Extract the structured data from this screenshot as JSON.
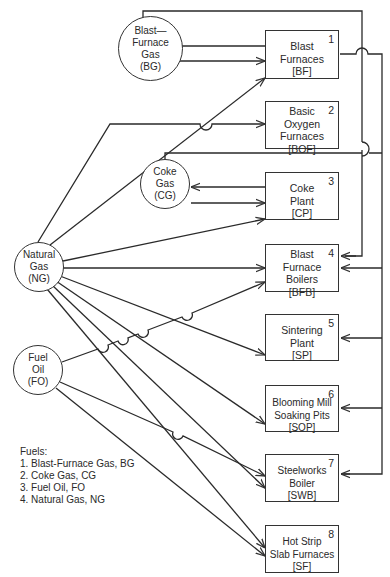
{
  "diagram": {
    "type": "energy flow diagram",
    "fuel_sources": [
      {
        "id": "BG",
        "lines": [
          "Blast—",
          "Furnace",
          "Gas",
          "(BG)"
        ]
      },
      {
        "id": "CG",
        "lines": [
          "Coke",
          "Gas",
          "(CG)"
        ]
      },
      {
        "id": "NG",
        "lines": [
          "Natural",
          "Gas",
          "(NG)"
        ]
      },
      {
        "id": "FO",
        "lines": [
          "Fuel",
          "Oil",
          "(FO)"
        ]
      }
    ],
    "units": [
      {
        "num": "1",
        "lines": [
          "Blast",
          "Furnaces",
          "[BF]"
        ]
      },
      {
        "num": "2",
        "lines": [
          "Basic",
          "Oxygen",
          "Furnaces",
          "[BOF]"
        ]
      },
      {
        "num": "3",
        "lines": [
          "Coke",
          "Plant",
          "[CP]"
        ]
      },
      {
        "num": "4",
        "lines": [
          "Blast",
          "Furnace",
          "Boilers",
          "[BFB]"
        ]
      },
      {
        "num": "5",
        "lines": [
          "Sintering",
          "Plant",
          "[SP]"
        ]
      },
      {
        "num": "6",
        "lines": [
          "Blooming Mill",
          "Soaking Pits",
          "[SOP]"
        ]
      },
      {
        "num": "7",
        "lines": [
          "Steelworks",
          "Boiler",
          "[SWB]"
        ]
      },
      {
        "num": "8",
        "lines": [
          "Hot Strip",
          "Slab Furnaces",
          "[SF]"
        ]
      }
    ],
    "legend": {
      "title": "Fuels:",
      "items": [
        "1.  Blast-Furnace Gas, BG",
        "2.  Coke Gas, CG",
        "3.  Fuel Oil, FO",
        "4.  Natural Gas, NG"
      ]
    },
    "flows": [
      {
        "from": "BF",
        "to": "BG"
      },
      {
        "from": "BG",
        "to": "BF"
      },
      {
        "from": "BG",
        "to": "BFB"
      },
      {
        "from": "CP",
        "to": "CG"
      },
      {
        "from": "CG",
        "to": "CP"
      },
      {
        "from": "CG",
        "to": [
          "BFB",
          "SP",
          "SOP",
          "SWB"
        ]
      },
      {
        "from": "NG",
        "to": [
          "BF",
          "BOF",
          "CP",
          "BFB",
          "SP",
          "SOP",
          "SWB",
          "SF"
        ]
      },
      {
        "from": "FO",
        "to": [
          "BFB",
          "SWB",
          "SF"
        ]
      }
    ]
  }
}
